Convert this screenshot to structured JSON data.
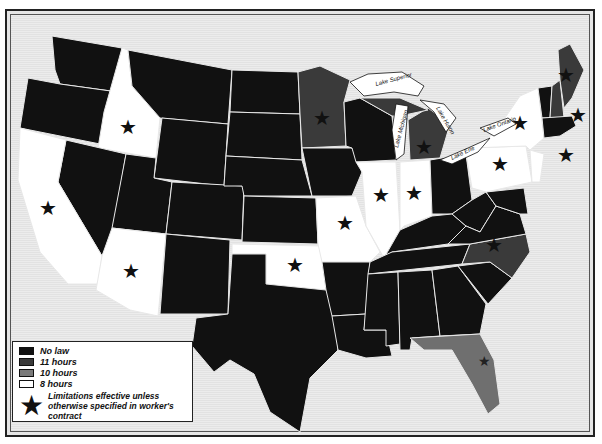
{
  "map": {
    "subject": "State hour limitations",
    "colors": {
      "no_law": "#111111",
      "eleven_hours": "#3a3a3a",
      "ten_hours": "#6f6f6f",
      "eight_hours": "#ffffff",
      "background": "#e6e6e6",
      "border": "#222222"
    },
    "lakes": [
      "Lake Superior",
      "Lake Michigan",
      "Lake Huron",
      "Lake Erie",
      "Lake Ontario"
    ],
    "states": {
      "eight_hours": [
        "Idaho",
        "California",
        "Arizona",
        "Oklahoma",
        "Missouri",
        "Illinois",
        "Indiana",
        "New York",
        "Pennsylvania",
        "New Jersey"
      ],
      "eleven_hours": [
        "Minnesota",
        "Michigan",
        "Maine",
        "New Hampshire",
        "North Carolina"
      ],
      "ten_hours": [
        "Florida"
      ],
      "no_law": [
        "Washington",
        "Oregon",
        "Nevada",
        "Montana",
        "Wyoming",
        "Utah",
        "Colorado",
        "New Mexico",
        "North Dakota",
        "South Dakota",
        "Nebraska",
        "Kansas",
        "Texas",
        "Iowa",
        "Wisconsin",
        "Arkansas",
        "Louisiana",
        "Mississippi",
        "Alabama",
        "Georgia",
        "South Carolina",
        "Tennessee",
        "Kentucky",
        "Ohio",
        "West Virginia",
        "Virginia",
        "Maryland",
        "Delaware",
        "Vermont",
        "Massachusetts",
        "Connecticut",
        "Rhode Island"
      ]
    },
    "starred_states": [
      "Idaho",
      "California",
      "Arizona",
      "Oklahoma",
      "Missouri",
      "Illinois",
      "Indiana",
      "Minnesota",
      "Michigan",
      "New York",
      "Pennsylvania",
      "Maine",
      "New Hampshire",
      "New Jersey",
      "North Carolina",
      "Florida"
    ]
  },
  "legend": {
    "items": [
      {
        "label": "No law",
        "color": "#111111"
      },
      {
        "label": "11 hours",
        "color": "#3a3a3a"
      },
      {
        "label": "10 hours",
        "color": "#7a7a7a"
      },
      {
        "label": "8 hours",
        "color": "#ffffff"
      }
    ],
    "star_note": "Limitations effective unless otherwise specified in worker's contract"
  }
}
